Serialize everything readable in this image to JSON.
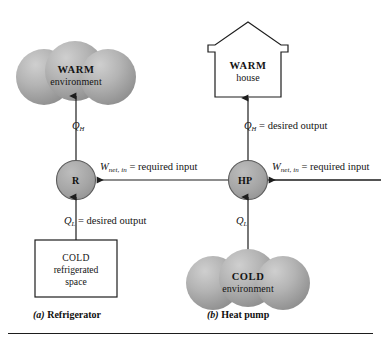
{
  "figure": {
    "background_color": "#ffffff",
    "line_color": "#1d1d1d",
    "reservoir_fill_light": "#c9c9c9",
    "reservoir_fill_dark": "#8e8e8e",
    "device_fill": "#a8a8a8"
  },
  "panel_a": {
    "caption_tag": "(a)",
    "caption_label": "Refrigerator",
    "hot_reservoir": {
      "shape": "cloud",
      "title": "WARM",
      "subtitle": "environment"
    },
    "device": {
      "shape": "circle",
      "letter": "R"
    },
    "cold_reservoir": {
      "shape": "box",
      "title": "COLD",
      "line2": "refrigerated",
      "line3": "space"
    },
    "flows": {
      "q_h_symbol": "Q",
      "q_h_sub": "H",
      "q_h_note": "",
      "q_l_symbol": "Q",
      "q_l_sub": "L",
      "q_l_note": "= desired output",
      "w_symbol": "W",
      "w_sub": "net, in",
      "w_note": "= required input"
    }
  },
  "panel_b": {
    "caption_tag": "(b)",
    "caption_label": "Heat pump",
    "hot_reservoir": {
      "shape": "house",
      "title": "WARM",
      "subtitle": "house"
    },
    "device": {
      "shape": "circle",
      "letter": "HP"
    },
    "cold_reservoir": {
      "shape": "cloud",
      "title": "COLD",
      "subtitle": "environment"
    },
    "flows": {
      "q_h_symbol": "Q",
      "q_h_sub": "H",
      "q_h_note": "= desired output",
      "q_l_symbol": "Q",
      "q_l_sub": "L",
      "q_l_note": "",
      "w_symbol": "W",
      "w_sub": "net, in",
      "w_note": "= required input"
    }
  }
}
